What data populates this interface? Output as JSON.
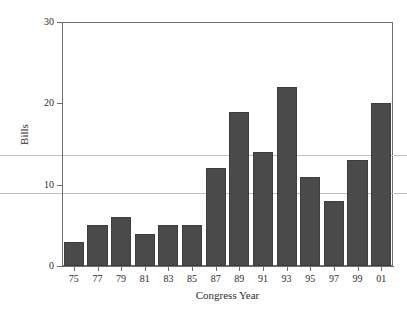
{
  "chart_data": {
    "type": "bar",
    "title": "",
    "subtitle": "",
    "xlabel": "Congress Year",
    "ylabel": "Bills",
    "categories": [
      "75",
      "77",
      "79",
      "81",
      "83",
      "85",
      "87",
      "89",
      "91",
      "93",
      "95",
      "97",
      "99",
      "01"
    ],
    "values": [
      3,
      5,
      6,
      4,
      5,
      5,
      12,
      19,
      14,
      22,
      11,
      8,
      13,
      20
    ],
    "ylim": [
      0,
      30
    ],
    "yticks": [
      0,
      10,
      20,
      30
    ],
    "ytick_labels": [
      "0",
      "10",
      "20",
      "30"
    ],
    "grid": true,
    "gridlines": [
      13.6,
      9.0
    ],
    "legend": "none",
    "bar_color": "#4a4a4a",
    "gridline_color": "#bfbfbf",
    "axis_color": "#6e6e6e",
    "background_color": "#ffffff"
  }
}
